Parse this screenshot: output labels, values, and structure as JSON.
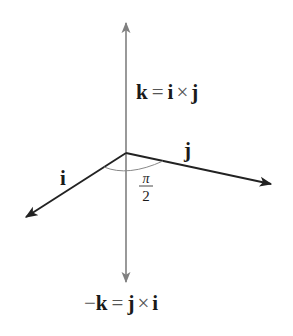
{
  "figure": {
    "type": "cross-product-right-hand-diagram",
    "colors": {
      "background": "#ffffff",
      "vertical_axis": "#808080",
      "vector": "#222222",
      "arc": "#888888",
      "text": "#1a1a1a"
    },
    "origin": [
      126,
      153
    ],
    "vectors": [
      {
        "name": "k",
        "label": "k = i × j",
        "tip": [
          126,
          22
        ]
      },
      {
        "name": "neg-k",
        "label": "−k = j × i",
        "tip": [
          126,
          283
        ]
      },
      {
        "name": "i",
        "label": "i",
        "tip": [
          25,
          218
        ]
      },
      {
        "name": "j",
        "label": "j",
        "tip": [
          272,
          184
        ]
      }
    ],
    "angle": {
      "numerator": "π",
      "denominator": "2",
      "text": "π/2"
    }
  },
  "labels": {
    "k_eq": {
      "lhs": "k",
      "eq": "=",
      "a": "i",
      "cross": "×",
      "b": "j"
    },
    "negk_eq": {
      "minus": "−",
      "lhs": "k",
      "eq": "=",
      "a": "j",
      "cross": "×",
      "b": "i"
    },
    "i": "i",
    "j": "j",
    "angle_num": "π",
    "angle_den": "2"
  }
}
